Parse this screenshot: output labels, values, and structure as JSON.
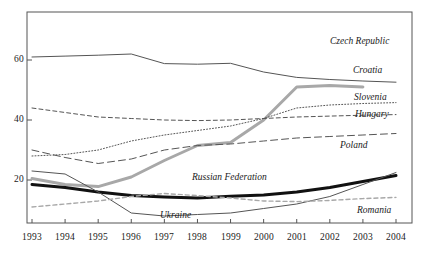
{
  "chart_data": {
    "type": "line",
    "title": "",
    "subtitle": "",
    "xlabel": "",
    "ylabel": "",
    "grid": false,
    "legend_position": "inline-right-labels",
    "x": [
      1993,
      1994,
      1995,
      1996,
      1997,
      1998,
      1999,
      2000,
      2001,
      2002,
      2003,
      2004
    ],
    "xlim": [
      1993,
      2004
    ],
    "ylim": [
      0,
      72
    ],
    "xtick_labels": [
      "1993",
      "1994",
      "1995",
      "1996",
      "1997",
      "1998",
      "1999",
      "2000",
      "2001",
      "2002",
      "2003",
      "2004"
    ],
    "ytick_labels": [
      "20",
      "40",
      "60"
    ],
    "yticks": [
      20,
      40,
      60
    ],
    "series": [
      {
        "name": "Czech Republic",
        "label": "Czech Republic",
        "color": "#555555",
        "style": "solid",
        "width": 1,
        "values": [
          61.0,
          61.3,
          61.6,
          62.0,
          58.8,
          58.6,
          58.9,
          56.0,
          54.2,
          53.5,
          53.0,
          52.6
        ]
      },
      {
        "name": "Croatia",
        "label": "Croatia",
        "color": "#a8a8a8",
        "style": "solid",
        "width": 3,
        "values": [
          20.5,
          18.5,
          17.8,
          21.0,
          26.5,
          31.5,
          32.5,
          40.0,
          51.0,
          51.5,
          51.0,
          null
        ]
      },
      {
        "name": "Slovenia",
        "label": "Slovenia",
        "color": "#555555",
        "style": "dotted",
        "width": 1,
        "values": [
          28.0,
          28.5,
          30.0,
          33.0,
          35.0,
          36.5,
          38.0,
          40.5,
          44.0,
          45.0,
          45.5,
          45.8
        ]
      },
      {
        "name": "Hungary",
        "label": "Hungary",
        "color": "#555555",
        "style": "dashed",
        "width": 1,
        "values": [
          44.0,
          42.5,
          41.0,
          40.5,
          40.0,
          39.8,
          40.0,
          40.5,
          41.0,
          41.3,
          41.6,
          41.8
        ]
      },
      {
        "name": "Poland",
        "label": "Poland",
        "color": "#555555",
        "style": "dashed-long",
        "width": 1,
        "values": [
          30.0,
          27.5,
          25.5,
          27.0,
          30.0,
          31.5,
          32.0,
          33.0,
          34.0,
          34.5,
          35.0,
          35.5
        ]
      },
      {
        "name": "Russian Federation",
        "label": "Russian Federation",
        "color": "#111111",
        "style": "solid",
        "width": 3,
        "values": [
          18.5,
          17.5,
          16.0,
          14.8,
          14.3,
          14.0,
          14.6,
          15.0,
          16.0,
          17.5,
          19.5,
          21.5
        ]
      },
      {
        "name": "Ukraine",
        "label": "Ukraine",
        "color": "#555555",
        "style": "solid",
        "width": 1,
        "values": [
          23.0,
          22.0,
          16.0,
          9.0,
          8.0,
          8.5,
          9.0,
          10.5,
          12.0,
          14.5,
          18.5,
          22.5
        ]
      },
      {
        "name": "Romania",
        "label": "Romania",
        "color": "#a8a8a8",
        "style": "dashed",
        "width": 1.4,
        "values": [
          11.0,
          12.0,
          13.0,
          14.5,
          15.5,
          14.8,
          14.0,
          13.0,
          12.8,
          13.2,
          13.8,
          14.2
        ]
      }
    ]
  },
  "axes": {
    "y": {
      "ticks": [
        {
          "label": "60"
        },
        {
          "label": "40"
        },
        {
          "label": "20"
        }
      ]
    },
    "x": {
      "ticks": [
        {
          "label": "1993"
        },
        {
          "label": "1994"
        },
        {
          "label": "1995"
        },
        {
          "label": "1996"
        },
        {
          "label": "1997"
        },
        {
          "label": "1998"
        },
        {
          "label": "1999"
        },
        {
          "label": "2000"
        },
        {
          "label": "2001"
        },
        {
          "label": "2002"
        },
        {
          "label": "2003"
        },
        {
          "label": "2004"
        }
      ]
    }
  },
  "annotations": [
    {
      "text": "Czech Republic"
    },
    {
      "text": "Croatia"
    },
    {
      "text": "Slovenia"
    },
    {
      "text": "Hungary"
    },
    {
      "text": "Poland"
    },
    {
      "text": "Russian Federation"
    },
    {
      "text": "Ukraine"
    },
    {
      "text": "Romania"
    }
  ],
  "colors": {
    "axis": "#555555",
    "thin_line": "#555555",
    "black_line": "#111111",
    "gray_line": "#a8a8a8",
    "background": "#ffffff"
  }
}
